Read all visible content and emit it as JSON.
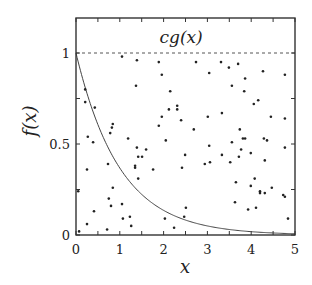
{
  "chart_data": {
    "type": "scatter",
    "title": "",
    "xlabel": "x",
    "ylabel": "f(x)",
    "xlim": [
      0,
      5
    ],
    "ylim": [
      0,
      1.19
    ],
    "grid": false,
    "legend": null,
    "x_ticks": [
      {
        "value": 0,
        "label": "0"
      },
      {
        "value": 1,
        "label": "1"
      },
      {
        "value": 2,
        "label": "2"
      },
      {
        "value": 3,
        "label": "3"
      },
      {
        "value": 4,
        "label": "4"
      },
      {
        "value": 5,
        "label": "5"
      }
    ],
    "x_minor_ticks": [
      0.5,
      1.5,
      2.5,
      3.5,
      4.5
    ],
    "y_ticks": [
      {
        "value": 0,
        "label": "0"
      },
      {
        "value": 0.5,
        "label": "0.5"
      },
      {
        "value": 1,
        "label": "1"
      }
    ],
    "y_minor_ticks": [
      0.25,
      0.75
    ],
    "annotations": [
      {
        "text": "cg(x)",
        "x": 2.4,
        "y": 1.09,
        "description": "label for dashed envelope line"
      }
    ],
    "series": [
      {
        "name": "cg(x)",
        "kind": "line",
        "style": "dashed",
        "color": "#555555",
        "x": [
          0,
          5
        ],
        "y": [
          1,
          1
        ]
      },
      {
        "name": "f(x)",
        "kind": "line",
        "style": "solid",
        "color": "#444444",
        "function": "exp(-x)",
        "x": [
          0,
          0.25,
          0.5,
          0.75,
          1,
          1.25,
          1.5,
          1.75,
          2,
          2.5,
          3,
          3.5,
          4,
          4.5,
          5
        ],
        "y": [
          1,
          0.779,
          0.607,
          0.472,
          0.368,
          0.287,
          0.223,
          0.174,
          0.135,
          0.082,
          0.05,
          0.03,
          0.018,
          0.011,
          0.007
        ]
      },
      {
        "name": "samples",
        "kind": "scatter",
        "color": "#222222",
        "points": [
          [
            1.05,
            0.98
          ],
          [
            1.39,
            0.96
          ],
          [
            1.37,
            0.82
          ],
          [
            0.21,
            0.8
          ],
          [
            0.21,
            0.73
          ],
          [
            0.43,
            0.7
          ],
          [
            0.84,
            0.61
          ],
          [
            0.82,
            0.59
          ],
          [
            0.78,
            0.56
          ],
          [
            0.27,
            0.54
          ],
          [
            1.19,
            0.53
          ],
          [
            0.39,
            0.51
          ],
          [
            1.39,
            0.48
          ],
          [
            1.6,
            0.47
          ],
          [
            1.42,
            0.43
          ],
          [
            1.51,
            0.43
          ],
          [
            0.73,
            0.39
          ],
          [
            1.35,
            0.38
          ],
          [
            1.35,
            0.37
          ],
          [
            1.76,
            0.36
          ],
          [
            0.25,
            0.36
          ],
          [
            1.42,
            0.31
          ],
          [
            0.05,
            0.24
          ],
          [
            0.84,
            0.26
          ],
          [
            0.75,
            0.2
          ],
          [
            1.05,
            0.17
          ],
          [
            0.8,
            0.16
          ],
          [
            0.41,
            0.13
          ],
          [
            1.07,
            0.09
          ],
          [
            1.23,
            0.1
          ],
          [
            0.25,
            0.06
          ],
          [
            1.26,
            0.05
          ],
          [
            0.71,
            0.03
          ],
          [
            0.07,
            0.02
          ],
          [
            1.89,
            0.95
          ],
          [
            2.74,
            0.95
          ],
          [
            3.31,
            0.95
          ],
          [
            1.96,
            0.88
          ],
          [
            3.04,
            0.89
          ],
          [
            2.15,
            0.79
          ],
          [
            2.31,
            0.71
          ],
          [
            2.12,
            0.69
          ],
          [
            2.31,
            0.69
          ],
          [
            1.96,
            0.65
          ],
          [
            3.01,
            0.65
          ],
          [
            3.33,
            0.67
          ],
          [
            2.4,
            0.63
          ],
          [
            1.89,
            0.6
          ],
          [
            2.69,
            0.58
          ],
          [
            2.05,
            0.52
          ],
          [
            3.04,
            0.49
          ],
          [
            3.49,
            0.92
          ],
          [
            3.7,
            0.94
          ],
          [
            4.27,
            0.9
          ],
          [
            4.77,
            0.88
          ],
          [
            3.86,
            0.86
          ],
          [
            3.56,
            0.82
          ],
          [
            3.84,
            0.79
          ],
          [
            4.16,
            0.74
          ],
          [
            4.06,
            0.72
          ],
          [
            4.45,
            0.65
          ],
          [
            4.77,
            0.64
          ],
          [
            3.74,
            0.58
          ],
          [
            3.81,
            0.53
          ],
          [
            3.86,
            0.53
          ],
          [
            4.29,
            0.53
          ],
          [
            4.36,
            0.52
          ],
          [
            3.56,
            0.51
          ],
          [
            2.49,
            0.44
          ],
          [
            3.33,
            0.44
          ],
          [
            2.94,
            0.39
          ],
          [
            3.06,
            0.4
          ],
          [
            2.42,
            0.37
          ],
          [
            4.77,
            0.48
          ],
          [
            3.77,
            0.47
          ],
          [
            3.99,
            0.45
          ],
          [
            3.72,
            0.43
          ],
          [
            4.31,
            0.41
          ],
          [
            3.52,
            0.4
          ],
          [
            4.08,
            0.31
          ],
          [
            3.65,
            0.29
          ],
          [
            3.99,
            0.27
          ],
          [
            4.47,
            0.26
          ],
          [
            4.2,
            0.24
          ],
          [
            4.2,
            0.23
          ],
          [
            4.31,
            0.23
          ],
          [
            4.73,
            0.22
          ],
          [
            4.77,
            0.21
          ],
          [
            3.63,
            0.18
          ],
          [
            3.93,
            0.14
          ],
          [
            4.11,
            0.15
          ],
          [
            4.84,
            0.09
          ],
          [
            2.51,
            0.15
          ],
          [
            2.03,
            0.09
          ],
          [
            2.47,
            0.1
          ],
          [
            2.24,
            0.04
          ]
        ]
      }
    ]
  },
  "layout": {
    "plot_left": 76,
    "plot_right": 295,
    "plot_top": 18,
    "plot_bottom": 235
  }
}
